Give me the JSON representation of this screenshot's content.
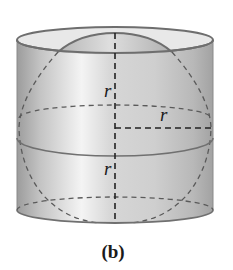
{
  "figure": {
    "caption": "(b)",
    "labels": {
      "upper_radius": "r",
      "horizontal_radius": "r",
      "lower_radius": "r"
    },
    "colors": {
      "cylinder_dark": "#9a9a9a",
      "cylinder_light": "#efefef",
      "outline": "#6e6e6e",
      "dashed": "#4a4a4a",
      "axis": "#222222",
      "top_face": "#e6e6e6"
    }
  }
}
